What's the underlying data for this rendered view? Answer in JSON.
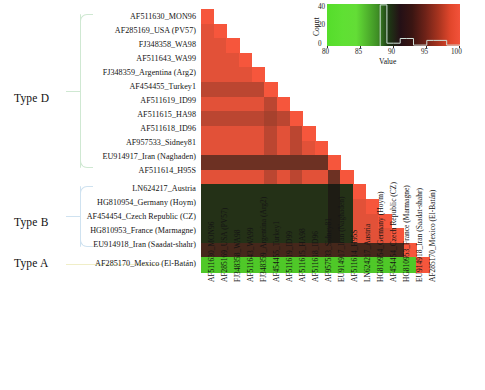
{
  "figure": {
    "type": "lower-triangular-heatmap"
  },
  "groups": [
    {
      "id": "type-d",
      "label": "Type D",
      "bracket_color": "#cfe8d2",
      "member_count": 12
    },
    {
      "id": "type-b",
      "label": "Type B",
      "bracket_color": "#cfe2f0",
      "member_count": 5
    },
    {
      "id": "type-a",
      "label": "Type A",
      "bracket_color": "#f0eec8",
      "member_count": 1
    }
  ],
  "taxa": [
    "AF511630_MON96",
    "AF285169_USA (PV57)",
    "FJ348358_WA98",
    "AF511643_WA99",
    "FJ348359_Argentina (Arg2)",
    "AF454455_Turkey1",
    "AF511619_ID99",
    "AF511615_HA98",
    "AF511618_ID96",
    "AF957533_Sidney81",
    "EU914917_Iran (Naghaden)",
    "AF511614_H95S",
    "LN624217_Austria",
    "HG810954_Germany (Hoym)",
    "AF454454_Czech Republic (CZ)",
    "HG810953_France (Marmagne)",
    "EU914918_Iran (Saadat-shahr)",
    "AF285170_Mexico (El-Batán)"
  ],
  "color_key": {
    "title": "Color Key and Histogram",
    "value_axis_label": "Value",
    "count_axis_label": "Count",
    "value_ticks": [
      "80",
      "85",
      "90",
      "95",
      "100"
    ],
    "count_ticks": [
      "0",
      "20",
      "40"
    ],
    "value_range": [
      80,
      100
    ],
    "count_range": [
      0,
      45
    ],
    "histogram": [
      {
        "bin": 88,
        "count": 44
      },
      {
        "bin": 89,
        "count": 3
      },
      {
        "bin": 90,
        "count": 3
      },
      {
        "bin": 91,
        "count": 8
      },
      {
        "bin": 92,
        "count": 8
      },
      {
        "bin": 93,
        "count": 1
      },
      {
        "bin": 94,
        "count": 1
      },
      {
        "bin": 95,
        "count": 6
      },
      {
        "bin": 96,
        "count": 6
      },
      {
        "bin": 97,
        "count": 6
      },
      {
        "bin": 98,
        "count": 1
      },
      {
        "bin": 99,
        "count": 1
      }
    ],
    "gradient_stops": [
      "#55dd2b",
      "#3f8f25",
      "#1d3a14",
      "#3a1512",
      "#a8341f",
      "#f2523a"
    ]
  },
  "chart_data": {
    "type": "heatmap",
    "xlabel": "",
    "ylabel": "",
    "value_label": "Value",
    "value_range": [
      80,
      100
    ],
    "colorscale": "green-black-red",
    "grid": false,
    "legend_position": "top-right",
    "triangular": "lower",
    "categories": [
      "AF511630_MON96",
      "AF285169_USA (PV57)",
      "FJ348358_WA98",
      "AF511643_WA99",
      "FJ348359_Argentina (Arg2)",
      "AF454455_Turkey1",
      "AF511619_ID99",
      "AF511615_HA98",
      "AF511618_ID96",
      "AF957533_Sidney81",
      "EU914917_Iran (Naghaden)",
      "AF511614_H95S",
      "LN624217_Austria",
      "HG810954_Germany (Hoym)",
      "AF454454_Czech Republic (CZ)",
      "HG810953_France (Marmagne)",
      "EU914918_Iran (Saadat-shahr)",
      "AF285170_Mexico (El-Batán)"
    ],
    "matrix": [
      [
        100
      ],
      [
        99,
        100
      ],
      [
        99,
        99,
        100
      ],
      [
        99,
        99,
        99,
        100
      ],
      [
        99,
        99,
        99,
        99,
        100
      ],
      [
        97,
        97,
        97,
        97,
        97,
        100
      ],
      [
        99,
        99,
        99,
        99,
        99,
        97,
        100
      ],
      [
        97,
        97,
        97,
        97,
        97,
        96,
        97,
        100
      ],
      [
        99,
        99,
        99,
        99,
        99,
        97,
        99,
        97,
        100
      ],
      [
        99,
        99,
        99,
        99,
        99,
        97,
        99,
        97,
        99,
        100
      ],
      [
        93,
        93,
        93,
        93,
        93,
        93,
        93,
        93,
        93,
        93,
        100
      ],
      [
        99,
        99,
        99,
        99,
        99,
        97,
        99,
        97,
        99,
        99,
        93,
        100
      ],
      [
        88,
        88,
        88,
        88,
        88,
        88,
        88,
        88,
        88,
        88,
        89,
        88,
        100
      ],
      [
        88,
        88,
        88,
        88,
        88,
        88,
        88,
        88,
        88,
        88,
        89,
        88,
        99,
        100
      ],
      [
        88,
        88,
        88,
        88,
        88,
        88,
        88,
        88,
        88,
        88,
        89,
        88,
        99,
        99,
        100
      ],
      [
        88,
        88,
        88,
        88,
        88,
        88,
        88,
        88,
        88,
        88,
        89,
        88,
        99,
        99,
        99,
        100
      ],
      [
        91,
        91,
        91,
        91,
        91,
        91,
        91,
        91,
        91,
        91,
        91,
        91,
        91,
        91,
        91,
        91,
        100
      ],
      [
        81,
        81,
        81,
        81,
        81,
        81,
        81,
        81,
        81,
        81,
        81,
        81,
        81,
        81,
        81,
        81,
        81,
        100
      ]
    ]
  }
}
